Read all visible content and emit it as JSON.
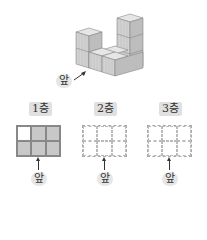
{
  "diagram": {
    "front_label": "앞",
    "floors": [
      {
        "label": "1층",
        "cells": [
          0,
          1,
          1,
          1,
          1,
          1
        ],
        "style": "solid"
      },
      {
        "label": "2층",
        "cells": [
          0,
          0,
          0,
          0,
          0,
          0
        ],
        "style": "dashed"
      },
      {
        "label": "3층",
        "cells": [
          0,
          0,
          0,
          0,
          0,
          0
        ],
        "style": "dashed"
      }
    ],
    "colors": {
      "cube_face": "#d4d4d4",
      "cube_top": "#e4e4e4",
      "cube_side": "#bcbcbc",
      "filled_cell": "#c8c8c8"
    }
  }
}
